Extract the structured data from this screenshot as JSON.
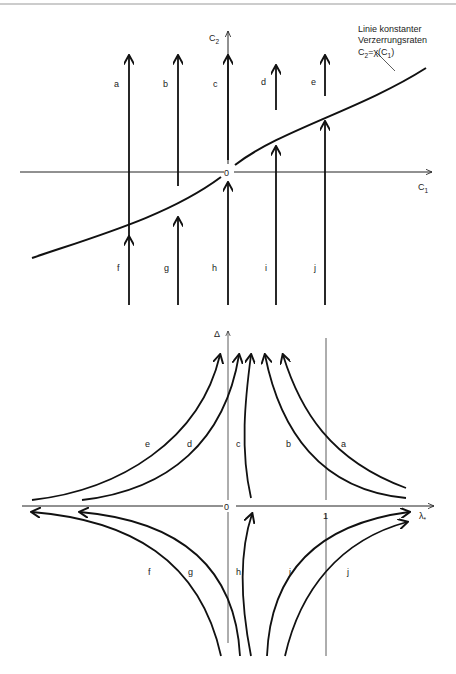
{
  "figure": {
    "top_diagram": {
      "y_axis_label": "C",
      "y_axis_sub": "2",
      "x_axis_label": "C",
      "x_axis_sub": "1",
      "origin_label": "0",
      "curve_annotation": {
        "line1": "Linie konstanter",
        "line2": "Verzerrungsraten",
        "line3_prefix": "C",
        "line3_sub": "2",
        "line3_mid": "=χ(C",
        "line3_sub2": "1",
        "line3_end": ")"
      },
      "upper_arrow_labels": [
        "a",
        "b",
        "c",
        "d",
        "e"
      ],
      "lower_arrow_labels": [
        "f",
        "g",
        "h",
        "i",
        "j"
      ]
    },
    "bottom_diagram": {
      "y_axis_label": "Δ",
      "x_axis_label": "λ",
      "x_axis_sub": "*",
      "origin_label": "0",
      "tick_one_label": "1",
      "upper_curve_labels": [
        "e",
        "d",
        "c",
        "b",
        "a"
      ],
      "lower_curve_labels": [
        "f",
        "g",
        "h",
        "i",
        "j"
      ]
    }
  }
}
